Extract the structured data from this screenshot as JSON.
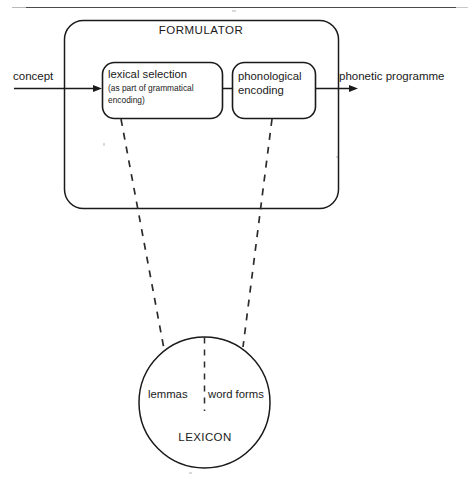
{
  "diagram": {
    "title": "FORMULATOR",
    "container_label": "FORMULATOR",
    "inputs": {
      "concept_label": "concept"
    },
    "outputs": {
      "phonetic_label": "phonetic programme"
    },
    "stages": [
      {
        "id": "lexical-selection",
        "line1": "lexical selection",
        "line2": "(as part of grammatical",
        "line3": "encoding)"
      },
      {
        "id": "phonological-encoding",
        "line1": "phonological",
        "line2": "encoding"
      }
    ],
    "store": {
      "name": "LEXICON",
      "left_partition_label": "lemmas",
      "right_partition_label": "word forms"
    },
    "colors": {
      "stroke": "#1a1a1a",
      "rule": "#4a4a4a",
      "background": "#ffffff",
      "dashed": "#2b2b2b"
    }
  }
}
